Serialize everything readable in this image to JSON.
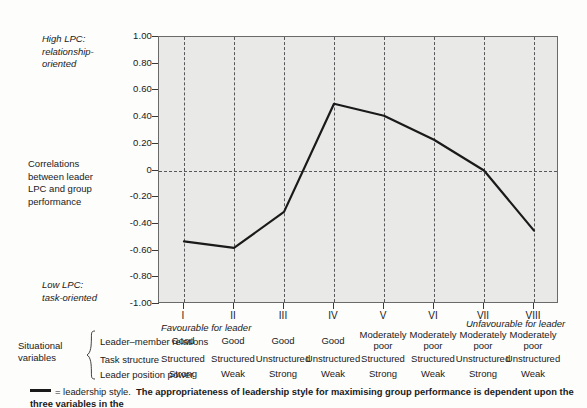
{
  "chart_data": {
    "type": "line",
    "title": "",
    "xlabel": "",
    "ylabel": "Correlations between leader LPC and group performance",
    "ylim": [
      -1.0,
      1.0
    ],
    "grid": "vertical-dashed",
    "legend": "below-plot",
    "categories": [
      "I",
      "II",
      "III",
      "IV",
      "V",
      "VI",
      "VII",
      "VIII"
    ],
    "series": [
      {
        "name": "leadership style",
        "values": [
          -0.53,
          -0.58,
          -0.31,
          0.5,
          0.41,
          0.23,
          0.0,
          -0.45
        ]
      }
    ],
    "ytick_labels": [
      "1.00",
      "0.80",
      "0.60",
      "0.40",
      "0.20",
      "0",
      "-0.20",
      "-0.40",
      "-0.60",
      "-0.80",
      "-1.00"
    ],
    "ytick_values": [
      1.0,
      0.8,
      0.6,
      0.4,
      0.2,
      0,
      -0.2,
      -0.4,
      -0.6,
      -0.8,
      -1.0
    ],
    "annotations": [
      "High LPC: relationship-oriented",
      "Low LPC: task-oriented",
      "Favourable for leader",
      "Unfavourable for leader"
    ]
  },
  "axis": {
    "y_captions": {
      "high": {
        "line1": "High LPC:",
        "line2": "relationship-",
        "line3": "oriented"
      },
      "middle": {
        "line1": "Correlations",
        "line2": "between leader",
        "line3": "LPC and group",
        "line4": "performance"
      },
      "low": {
        "line1": "Low LPC:",
        "line2": "task-oriented"
      }
    },
    "x_notes": {
      "favourable": "Favourable for leader",
      "unfavourable": "Unfavourable for leader"
    }
  },
  "situational_variables": {
    "title": {
      "line1": "Situational",
      "line2": "variables"
    },
    "brace": "{",
    "row_labels": [
      "Leader–member relations",
      "Task structure",
      "Leader position power"
    ],
    "rows": [
      [
        "Good",
        "Good",
        "Good",
        "Good",
        "Moderately poor",
        "Moderately poor",
        "Moderately poor",
        "Moderately poor"
      ],
      [
        "Structured",
        "Structured",
        "Unstructured",
        "Unstructured",
        "Structured",
        "Structured",
        "Unstructured",
        "Unstructured"
      ],
      [
        "Strong",
        "Weak",
        "Strong",
        "Weak",
        "Strong",
        "Weak",
        "Strong",
        "Weak"
      ]
    ]
  },
  "footnote": {
    "swatch_meaning": "= leadership style.",
    "text": "The appropriateness of leadership style for maximising group performance is dependent upon the three variables in the"
  },
  "colors": {
    "plot_background": "#e9e9e7",
    "line": "#1a1a1a",
    "grid": "#58585a",
    "frame": "#6a6a6a",
    "page_background": "#fdfdfc"
  }
}
